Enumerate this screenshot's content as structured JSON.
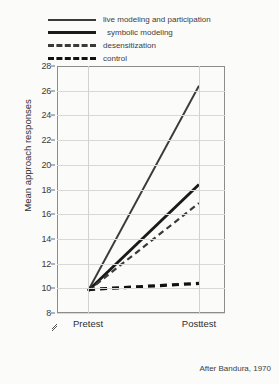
{
  "chart_data": {
    "type": "line",
    "title": "",
    "subtitle": "",
    "xlabel": "",
    "ylabel": "Mean approach responses",
    "categories": [
      "Pretest",
      "Posttest"
    ],
    "x": [
      0,
      1
    ],
    "ylim": [
      8,
      28
    ],
    "y_ticks": [
      28,
      26,
      24,
      22,
      20,
      18,
      16,
      14,
      12,
      10,
      8
    ],
    "y_axis_break": true,
    "grid": "horizontal-and-vertical",
    "legend_position": "above-plot",
    "annotation": "After Bandura, 1970",
    "series": [
      {
        "name": "live modeling and participation",
        "style": "solid-thin",
        "color": "#3a3a3a",
        "values": [
          9.8,
          26.4
        ]
      },
      {
        "name": "symbolic modeling",
        "style": "solid-thick",
        "color": "#1a1a1a",
        "values": [
          9.8,
          18.4
        ]
      },
      {
        "name": "desensitization",
        "style": "dashed-thin",
        "color": "#3a3a3a",
        "values": [
          9.8,
          16.9
        ]
      },
      {
        "name": "control",
        "style": "dashed-thick",
        "color": "#111111",
        "values": [
          9.9,
          10.4
        ]
      }
    ]
  },
  "legend": {
    "items": [
      {
        "label": "live modeling and participation",
        "swatch": "solid-thin"
      },
      {
        "label": "symbolic modeling",
        "swatch": "solid-thick"
      },
      {
        "label": "desensitization",
        "swatch": "dashed-thin"
      },
      {
        "label": "control",
        "swatch": "dashed-thick"
      }
    ]
  },
  "axes": {
    "y_label": "Mean approach responses",
    "y_tick_labels": [
      "28",
      "26",
      "24",
      "22",
      "20",
      "18",
      "16",
      "14",
      "12",
      "10",
      "8"
    ],
    "x_tick_labels": [
      "Pretest",
      "Posttest"
    ]
  },
  "caption": {
    "text": "After Bandura, 1970"
  },
  "colors": {
    "background": "#fbfbfa",
    "frame": "#8c8c8c",
    "grid": "#d8d8d6",
    "text": "#2e2e2e"
  }
}
